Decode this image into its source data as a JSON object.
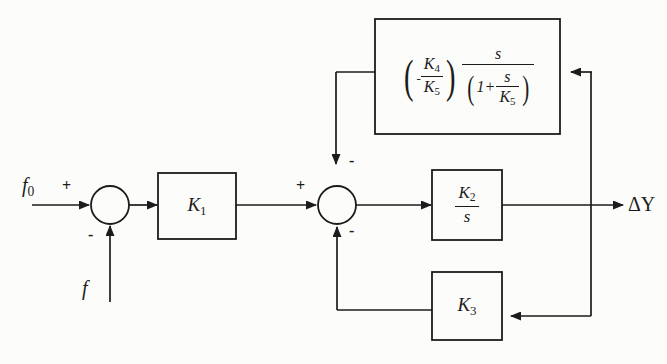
{
  "diagram": {
    "type": "control-system-block-diagram",
    "title": "",
    "ink_color": "#1c1c1c",
    "background_color": "#fcfcfa",
    "inputs": [
      {
        "name": "f0",
        "label": "f",
        "subscript": "0",
        "sign": "+"
      },
      {
        "name": "f",
        "label": "f",
        "subscript": "",
        "sign": "-"
      }
    ],
    "outputs": [
      {
        "name": "delta-y",
        "label": "ΔY"
      }
    ],
    "summing_junctions": [
      {
        "id": "sum-1",
        "cx": 110,
        "cy": 205,
        "r": 19,
        "signs": [
          {
            "position": "left",
            "symbol": "+"
          },
          {
            "position": "bottom",
            "symbol": "-"
          }
        ]
      },
      {
        "id": "sum-2",
        "cx": 337,
        "cy": 205,
        "r": 19,
        "signs": [
          {
            "position": "left",
            "symbol": "+"
          },
          {
            "position": "top",
            "symbol": "-"
          },
          {
            "position": "bottom",
            "symbol": "-"
          }
        ]
      }
    ],
    "blocks": [
      {
        "id": "block-k1",
        "label": "K",
        "subscript": "1",
        "x": 158,
        "y": 173,
        "w": 78,
        "h": 66,
        "kind": "gain"
      },
      {
        "id": "block-k2-over-s",
        "numerator": "K",
        "numerator_sub": "2",
        "denominator": "s",
        "x": 432,
        "y": 170,
        "w": 70,
        "h": 70,
        "kind": "integrator"
      },
      {
        "id": "block-k3",
        "label": "K",
        "subscript": "3",
        "x": 432,
        "y": 272,
        "w": 70,
        "h": 68,
        "kind": "gain"
      },
      {
        "id": "block-washout",
        "x": 375,
        "y": 19,
        "w": 185,
        "h": 115,
        "kind": "washout-filter",
        "expression_parts": {
          "leading_sign": "-",
          "gain_numerator": "K",
          "gain_numerator_sub": "4",
          "gain_denominator": "K",
          "gain_denominator_sub": "5",
          "frac_numerator": "s",
          "frac_den_one": "1+",
          "frac_den_num": "s",
          "frac_den_den": "K",
          "frac_den_den_sub": "5"
        }
      }
    ],
    "signal_paths": [
      {
        "id": "path-f0-to-sum1",
        "from": "f0",
        "to": "sum-1"
      },
      {
        "id": "path-f-to-sum1",
        "from": "f",
        "to": "sum-1"
      },
      {
        "id": "path-sum1-to-k1",
        "from": "sum-1",
        "to": "block-k1"
      },
      {
        "id": "path-k1-to-sum2",
        "from": "block-k1",
        "to": "sum-2"
      },
      {
        "id": "path-sum2-to-k2",
        "from": "sum-2",
        "to": "block-k2-over-s"
      },
      {
        "id": "path-k2-to-output",
        "from": "block-k2-over-s",
        "to": "delta-y"
      },
      {
        "id": "path-takeoff-to-washout",
        "from": "takeoff",
        "to": "block-washout"
      },
      {
        "id": "path-washout-to-sum2",
        "from": "block-washout",
        "to": "sum-2"
      },
      {
        "id": "path-takeoff-to-k3",
        "from": "takeoff",
        "to": "block-k3"
      },
      {
        "id": "path-k3-to-sum2",
        "from": "block-k3",
        "to": "sum-2"
      }
    ]
  }
}
